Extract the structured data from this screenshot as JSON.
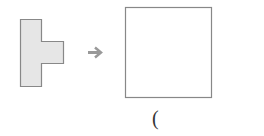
{
  "figure": {
    "source_shape": {
      "label": "T-shaped polygon",
      "fill": "#e6e6e6",
      "stroke": "#888888"
    },
    "arrow": {
      "symbol": "→",
      "color": "#999999"
    },
    "target_square": {
      "label": "empty square",
      "fill": "#ffffff",
      "stroke": "#888888"
    },
    "caption": "("
  }
}
